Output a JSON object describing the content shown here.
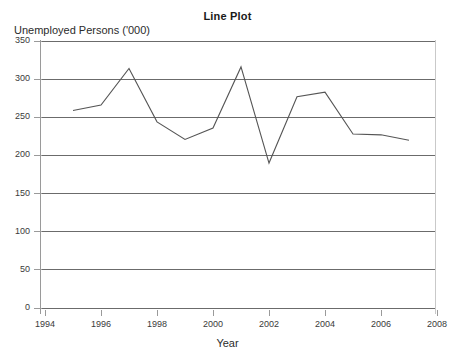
{
  "chart_data": {
    "type": "line",
    "title": "Line Plot",
    "xlabel": "Year",
    "ylabel": "Unemployed Persons ('000)",
    "x": [
      1995,
      1996,
      1997,
      1998,
      1999,
      2000,
      2001,
      2002,
      2003,
      2004,
      2005,
      2006,
      2007
    ],
    "values": [
      259,
      266,
      314,
      244,
      221,
      236,
      316,
      190,
      277,
      283,
      228,
      227,
      220
    ],
    "series": [
      {
        "name": "Unemployed Persons ('000)",
        "values": [
          259,
          266,
          314,
          244,
          221,
          236,
          316,
          190,
          277,
          283,
          228,
          227,
          220
        ]
      }
    ],
    "xlim": [
      1994,
      2008
    ],
    "ylim": [
      0,
      350
    ],
    "xticks": [
      1994,
      1996,
      1998,
      2000,
      2002,
      2004,
      2006,
      2008
    ],
    "xtick_labels": [
      "1994",
      "1996",
      "1998",
      "2000",
      "2002",
      "2004",
      "2006",
      "2008"
    ],
    "yticks": [
      0,
      50,
      100,
      150,
      200,
      250,
      300,
      350
    ],
    "ytick_labels": [
      "0",
      "50",
      "100",
      "150",
      "200",
      "250",
      "300",
      "350"
    ],
    "grid": "horizontal",
    "legend": "none",
    "line_color": "#555555",
    "grid_color": "#6b6b6b",
    "axis_color": "#9a9a9a",
    "background": "#ffffff"
  }
}
